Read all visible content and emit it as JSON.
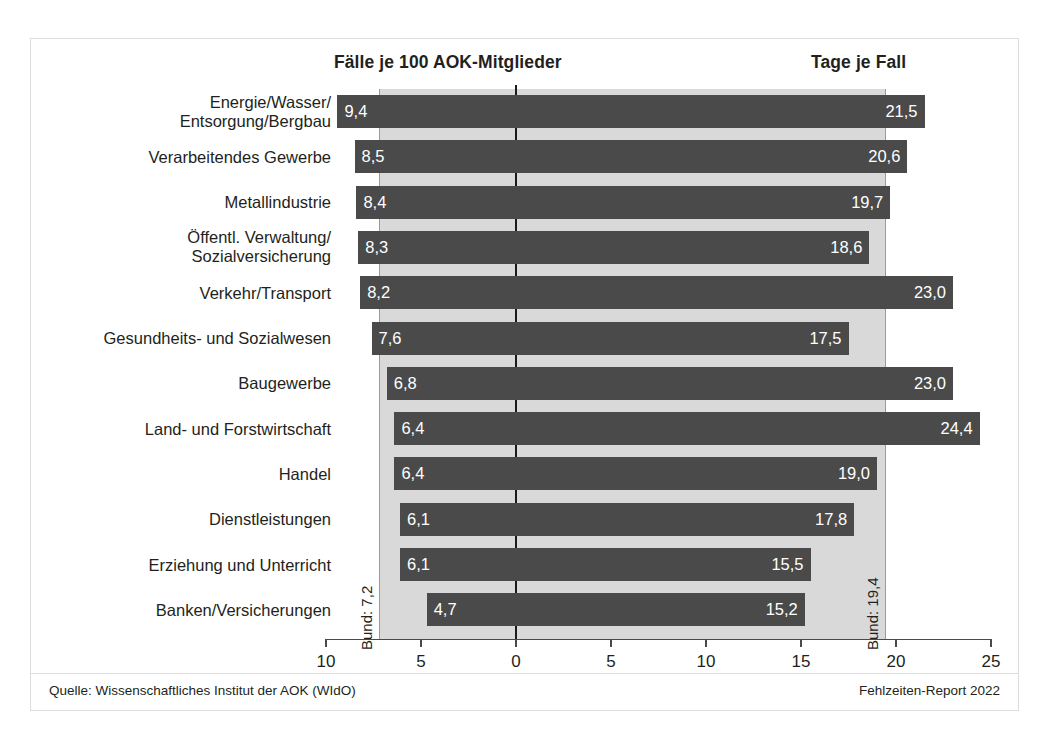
{
  "header": {
    "left_title": "Fälle je 100 AOK-Mitglieder",
    "right_title": "Tage je Fall"
  },
  "footer": {
    "source": "Quelle: Wissenschaftliches Institut der AOK (WIdO)",
    "report": "Fehlzeiten-Report 2022"
  },
  "reference": {
    "left_label": "Bund: 7,2",
    "right_label": "Bund: 19,4",
    "left_value": 7.2,
    "right_value": 19.4
  },
  "colors": {
    "bar": "#4a4a4a",
    "band": "#d9d9d9",
    "axis": "#4a4a4a",
    "frame": "#dcdcdc",
    "text": "#231f20",
    "bar_label": "#ffffff"
  },
  "chart_data": {
    "type": "bar",
    "orientation": "horizontal-bidirectional",
    "title": "",
    "xlabel": "",
    "ylabel": "",
    "grid": false,
    "legend": false,
    "axis_ticks": [
      {
        "label": "10",
        "value": -10
      },
      {
        "label": "5",
        "value": -5
      },
      {
        "label": "0",
        "value": 0
      },
      {
        "label": "5",
        "value": 5
      },
      {
        "label": "10",
        "value": 10
      },
      {
        "label": "15",
        "value": 15
      },
      {
        "label": "20",
        "value": 20
      },
      {
        "label": "25",
        "value": 25
      }
    ],
    "xlim": [
      -10,
      25
    ],
    "categories": [
      "Energie/Wasser/\nEntsorgung/Bergbau",
      "Verarbeitendes Gewerbe",
      "Metallindustrie",
      "Öffentl. Verwaltung/\nSozialversicherung",
      "Verkehr/Transport",
      "Gesundheits- und Sozialwesen",
      "Baugewerbe",
      "Land- und Forstwirtschaft",
      "Handel",
      "Dienstleistungen",
      "Erziehung und Unterricht",
      "Banken/Versicherungen"
    ],
    "series": [
      {
        "name": "Fälle je 100 AOK-Mitglieder",
        "side": "left",
        "values": [
          9.4,
          8.5,
          8.4,
          8.3,
          8.2,
          7.6,
          6.8,
          6.4,
          6.4,
          6.1,
          6.1,
          4.7
        ],
        "labels": [
          "9,4",
          "8,5",
          "8,4",
          "8,3",
          "8,2",
          "7,6",
          "6,8",
          "6,4",
          "6,4",
          "6,1",
          "6,1",
          "4,7"
        ]
      },
      {
        "name": "Tage je Fall",
        "side": "right",
        "values": [
          21.5,
          20.6,
          19.7,
          18.6,
          23.0,
          17.5,
          23.0,
          24.4,
          19.0,
          17.8,
          15.5,
          15.2
        ],
        "labels": [
          "21,5",
          "20,6",
          "19,7",
          "18,6",
          "23,0",
          "17,5",
          "23,0",
          "24,4",
          "19,0",
          "17,8",
          "15,5",
          "15,2"
        ]
      }
    ]
  }
}
